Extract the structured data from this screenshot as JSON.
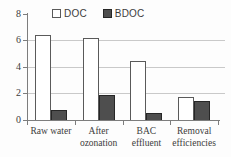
{
  "chart_data": {
    "type": "bar",
    "title": "",
    "xlabel": "",
    "ylabel": "",
    "categories": [
      "Raw water",
      "After ozonation",
      "BAC effluent",
      "Removal efficiencies"
    ],
    "category_lines": [
      [
        "Raw water"
      ],
      [
        "After",
        "ozonation"
      ],
      [
        "BAC",
        "effluent"
      ],
      [
        "Removal",
        "efficiencies"
      ]
    ],
    "series": [
      {
        "name": "DOC",
        "values": [
          6.4,
          6.2,
          4.4,
          1.75
        ],
        "fill": "#ffffff",
        "border": "#5a5a5a"
      },
      {
        "name": "BDOC",
        "values": [
          0.75,
          1.9,
          0.5,
          1.4
        ],
        "fill": "#4e4e4e",
        "border": "#262626"
      }
    ],
    "ylim": [
      0,
      8
    ],
    "yticks": [
      0,
      2,
      4,
      6,
      8
    ],
    "gridline_values": [
      2,
      4,
      6
    ],
    "grid": true,
    "legend_position": "top-inside"
  },
  "colors": {
    "axis": "#7d7d7d",
    "gridline": "#c9c9c9",
    "text": "#3c3c3c",
    "background": "#fdfdfd"
  }
}
